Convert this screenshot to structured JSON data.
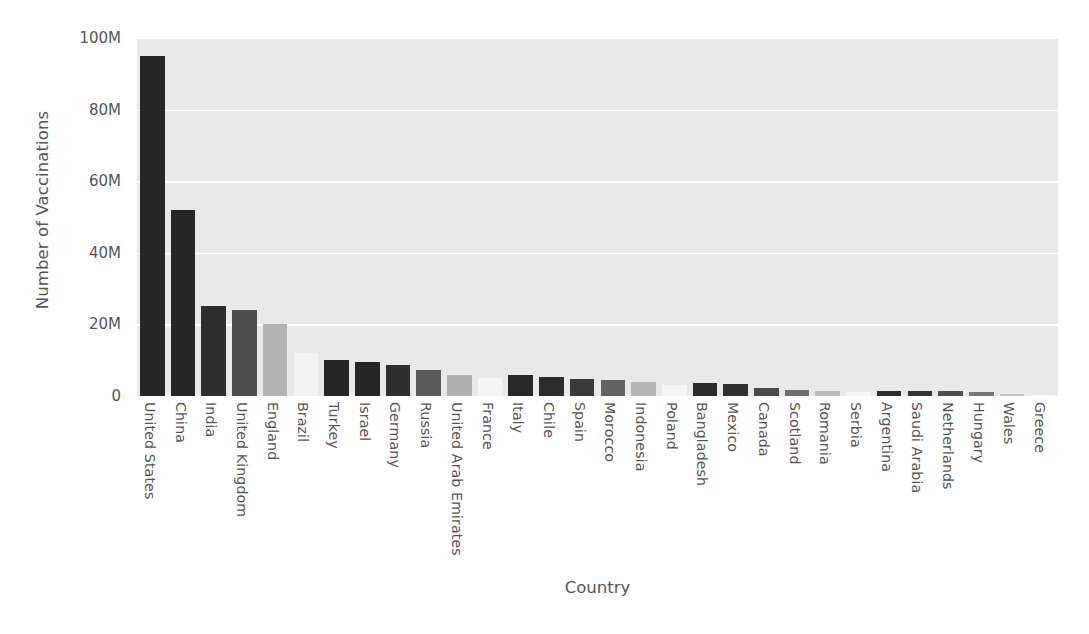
{
  "chart_data": {
    "type": "bar",
    "title": "",
    "xlabel": "Country",
    "ylabel": "Number of Vaccinations",
    "ylim": [
      0,
      100000000
    ],
    "grid": true,
    "legend": null,
    "ytick_labels": [
      "0",
      "20M",
      "40M",
      "60M",
      "80M",
      "100M"
    ],
    "ytick_values": [
      0,
      20000000,
      40000000,
      60000000,
      80000000,
      100000000
    ],
    "categories": [
      "United States",
      "China",
      "India",
      "United Kingdom",
      "England",
      "Brazil",
      "Turkey",
      "Israel",
      "Germany",
      "Russia",
      "United Arab Emirates",
      "France",
      "Italy",
      "Chile",
      "Spain",
      "Morocco",
      "Indonesia",
      "Poland",
      "Bangladesh",
      "Mexico",
      "Canada",
      "Scotland",
      "Romania",
      "Serbia",
      "Argentina",
      "Saudi Arabia",
      "Netherlands",
      "Hungary",
      "Wales",
      "Greece"
    ],
    "values": [
      95000000,
      52000000,
      25200000,
      24000000,
      20200000,
      12000000,
      10000000,
      9400000,
      8700000,
      7200000,
      6000000,
      4900000,
      5800000,
      5400000,
      4800000,
      4400000,
      3900000,
      3200000,
      3500000,
      3300000,
      2300000,
      1800000,
      1500000,
      1200000,
      1500000,
      1400000,
      1300000,
      1100000,
      700000,
      400000
    ],
    "bar_colors": [
      "#262626",
      "#262626",
      "#2e2e2e",
      "#4d4d4d",
      "#b3b3b3",
      "#f2f2f2",
      "#262626",
      "#262626",
      "#2e2e2e",
      "#5a5a5a",
      "#b0b0b0",
      "#f4f4f4",
      "#282828",
      "#2c2c2c",
      "#3a3a3a",
      "#636363",
      "#b5b5b5",
      "#f5f5f5",
      "#2a2a2a",
      "#2f2f2f",
      "#4a4a4a",
      "#6f6f6f",
      "#bbbbbb",
      "#f6f6f6",
      "#2d2d2d",
      "#333333",
      "#4f4f4f",
      "#777777",
      "#c0c0c0",
      "#f7f7f7"
    ],
    "colors": {
      "plot_background": "#e9e9e9",
      "gridline": "#ffffff",
      "text": "#555555",
      "figure_background": "#ffffff"
    }
  }
}
